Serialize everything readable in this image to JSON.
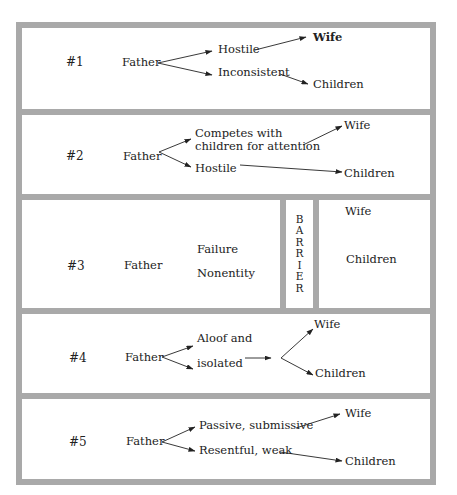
{
  "diagram": {
    "panels": [
      {
        "number": "#1",
        "father": "Father",
        "upper": "Hostile",
        "lower": "Inconsistent",
        "target_upper": "Wife",
        "target_lower": "Children"
      },
      {
        "number": "#2",
        "father": "Father",
        "upper_line1": "Competes with",
        "upper_line2": "children for attention",
        "lower": "Hostile",
        "target_upper": "Wife",
        "target_lower": "Children"
      },
      {
        "number": "#3",
        "father": "Father",
        "upper": "Failure",
        "lower": "Nonentity",
        "barrier_letters": [
          "B",
          "A",
          "R",
          "R",
          "I",
          "E",
          "R"
        ],
        "target_upper": "Wife",
        "target_lower": "Children"
      },
      {
        "number": "#4",
        "father": "Father",
        "upper": "Aloof and",
        "lower": "isolated",
        "target_upper": "Wife",
        "target_lower": "Children"
      },
      {
        "number": "#5",
        "father": "Father",
        "upper": "Passive, submissive",
        "lower": "Resentful, weak",
        "target_upper": "Wife",
        "target_lower": "Children"
      }
    ],
    "colors": {
      "border": "#a9a9a9",
      "text": "#222222"
    }
  }
}
